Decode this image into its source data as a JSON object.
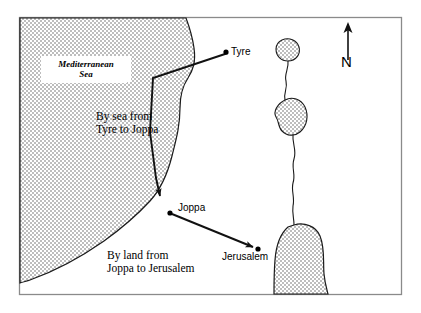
{
  "map": {
    "title_label": "Mediterranean Sea",
    "sea_label_line1": "Mediterranean",
    "sea_label_line2": "Sea",
    "routes": [
      {
        "id": "sea-route",
        "label_line1": "By sea from",
        "label_line2": "Tyre to Joppa",
        "from": "Tyre",
        "to": "Joppa",
        "mode": "sea"
      },
      {
        "id": "land-route",
        "label_line1": "By land from",
        "label_line2": "Joppa to Jerusalem",
        "from": "Joppa",
        "to": "Jerusalem",
        "mode": "land"
      }
    ],
    "cities": [
      {
        "id": "tyre",
        "label": "Tyre"
      },
      {
        "id": "joppa",
        "label": "Joppa"
      },
      {
        "id": "jerusalem",
        "label": "Jerusalem"
      }
    ],
    "compass": {
      "direction_label": "N",
      "icon": "north-arrow-icon"
    },
    "colors": {
      "water_fill": "#c9c9c9",
      "outline": "#1a1a1a",
      "frame": "#8a8a8a",
      "background": "#ffffff"
    }
  }
}
